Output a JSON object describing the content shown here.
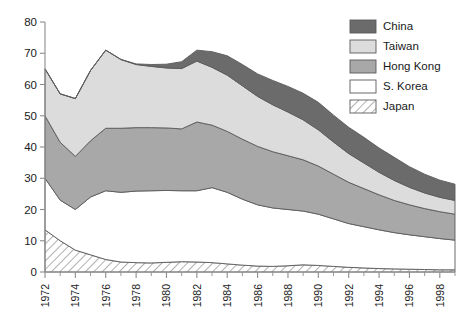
{
  "chart_data": {
    "type": "area",
    "stacked": true,
    "title": "",
    "subtitle": "",
    "xlabel": "",
    "ylabel": "",
    "xlim": [
      1972,
      1999
    ],
    "ylim": [
      0,
      80
    ],
    "yticks": [
      0,
      10,
      20,
      30,
      40,
      50,
      60,
      70,
      80
    ],
    "ytick_labels": [
      "0",
      "10",
      "20",
      "30",
      "40",
      "50",
      "60",
      "70",
      "80"
    ],
    "xticks": [
      1972,
      1974,
      1976,
      1978,
      1980,
      1982,
      1984,
      1986,
      1988,
      1990,
      1992,
      1994,
      1996,
      1998
    ],
    "xtick_labels": [
      "1972",
      "1974",
      "1976",
      "1978",
      "1980",
      "1982",
      "1984",
      "1986",
      "1988",
      "1990",
      "1992",
      "1994",
      "1996",
      "1998"
    ],
    "xtick_minor_step": 1,
    "xtick_rotation": 90,
    "grid": false,
    "legend_position": "top-right",
    "stack_order_bottom_to_top": [
      "Japan",
      "S. Korea",
      "Hong Kong",
      "Taiwan",
      "China"
    ],
    "x": [
      1972,
      1973,
      1974,
      1975,
      1976,
      1977,
      1978,
      1979,
      1980,
      1981,
      1982,
      1983,
      1984,
      1985,
      1986,
      1987,
      1988,
      1989,
      1990,
      1991,
      1992,
      1993,
      1994,
      1995,
      1996,
      1997,
      1998,
      1999
    ],
    "series": [
      {
        "name": "Japan",
        "color": "#ffffff",
        "pattern": "diagonal-hatch",
        "values": [
          13.5,
          10.0,
          7.0,
          5.5,
          4.0,
          3.2,
          3.0,
          2.9,
          3.1,
          3.3,
          3.2,
          3.0,
          2.6,
          2.2,
          1.9,
          1.8,
          2.0,
          2.3,
          2.1,
          1.8,
          1.5,
          1.3,
          1.1,
          1.0,
          0.9,
          0.8,
          0.7,
          0.7
        ]
      },
      {
        "name": "S. Korea",
        "color": "#ffffff",
        "pattern": "solid",
        "values": [
          16.5,
          13.0,
          13.0,
          18.5,
          22.0,
          22.3,
          22.9,
          23.1,
          23.0,
          22.7,
          22.8,
          24.0,
          22.9,
          21.1,
          19.6,
          18.7,
          18.0,
          17.2,
          16.4,
          15.2,
          14.0,
          13.2,
          12.4,
          11.6,
          11.0,
          10.5,
          10.0,
          9.5
        ]
      },
      {
        "name": "Hong Kong",
        "color": "#a8a8a8",
        "pattern": "solid",
        "values": [
          20.0,
          18.5,
          17.0,
          18.0,
          20.0,
          20.5,
          20.3,
          20.2,
          20.0,
          19.8,
          22.0,
          20.0,
          19.5,
          19.2,
          18.7,
          18.0,
          17.2,
          16.4,
          15.4,
          14.3,
          13.2,
          12.2,
          11.2,
          10.3,
          9.6,
          9.0,
          8.6,
          8.3
        ]
      },
      {
        "name": "Taiwan",
        "color": "#dcdcdc",
        "pattern": "solid",
        "values": [
          15.0,
          15.5,
          18.5,
          22.5,
          25.0,
          22.0,
          20.2,
          19.6,
          19.2,
          19.3,
          19.5,
          18.5,
          18.0,
          17.1,
          16.0,
          15.0,
          14.0,
          12.8,
          11.6,
          10.3,
          9.2,
          8.2,
          7.2,
          6.4,
          5.6,
          5.0,
          4.6,
          4.4
        ]
      },
      {
        "name": "China",
        "color": "#6b6b6b",
        "pattern": "solid",
        "values": [
          0.0,
          0.0,
          0.0,
          0.0,
          0.0,
          0.0,
          0.2,
          0.6,
          1.2,
          2.2,
          3.5,
          5.0,
          6.2,
          6.8,
          7.2,
          7.8,
          8.2,
          8.5,
          8.8,
          8.6,
          8.4,
          8.2,
          7.8,
          7.4,
          6.6,
          6.0,
          5.5,
          5.2
        ]
      }
    ],
    "totals": [
      65.0,
      57.0,
      55.5,
      64.5,
      71.0,
      68.0,
      66.6,
      66.4,
      66.5,
      67.3,
      71.0,
      70.5,
      69.2,
      66.4,
      63.4,
      61.3,
      59.4,
      57.2,
      54.3,
      50.2,
      46.3,
      43.1,
      39.7,
      36.7,
      33.7,
      31.3,
      29.4,
      28.1
    ]
  },
  "legend": {
    "items": [
      {
        "label": "China",
        "color": "#6b6b6b",
        "swatch": "solid-swatch"
      },
      {
        "label": "Taiwan",
        "color": "#dcdcdc",
        "swatch": "solid-swatch"
      },
      {
        "label": "Hong Kong",
        "color": "#a8a8a8",
        "swatch": "solid-swatch"
      },
      {
        "label": "S. Korea",
        "color": "#ffffff",
        "swatch": "solid-swatch"
      },
      {
        "label": "Japan",
        "color": "#ffffff",
        "swatch": "hatch-swatch"
      }
    ]
  }
}
